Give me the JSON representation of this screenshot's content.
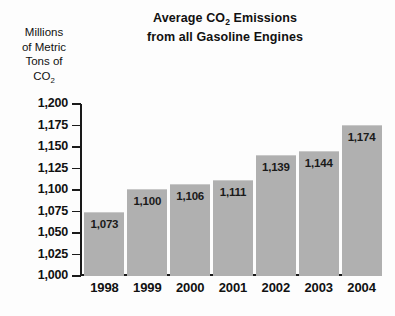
{
  "chart_data": {
    "type": "bar",
    "title": "Average CO2 Emissions from all Gasoline Engines",
    "title_lines": [
      "Average CO",
      "Emissions",
      "from all Gasoline Engines"
    ],
    "title_line1_prefix": "Average CO",
    "title_line1_sub": "2",
    "title_line1_suffix": " Emissions",
    "title_line2": "from all Gasoline Engines",
    "ylabel": "Millions of Metric Tons of CO2",
    "ylabel_lines": [
      "Millions",
      "of Metric",
      "Tons of"
    ],
    "ylabel_last_prefix": "CO",
    "ylabel_last_sub": "2",
    "xlabel": "",
    "categories": [
      "1998",
      "1999",
      "2000",
      "2001",
      "2002",
      "2003",
      "2004"
    ],
    "values": [
      1073,
      1100,
      1106,
      1111,
      1139,
      1144,
      1174
    ],
    "value_labels": [
      "1,073",
      "1,100",
      "1,106",
      "1,111",
      "1,139",
      "1,144",
      "1,174"
    ],
    "ylim": [
      1000,
      1200
    ],
    "ytick_values": [
      1200,
      1175,
      1150,
      1125,
      1100,
      1075,
      1050,
      1025,
      1000
    ],
    "ytick_labels": [
      "1,200",
      "1,175",
      "1,150",
      "1,125",
      "1,100",
      "1,075",
      "1,050",
      "1,025",
      "1,000"
    ],
    "grid": false,
    "legend": "none",
    "bar_color": "#b0b0b0",
    "axis_color": "#1a1a1a",
    "text_color": "#111111",
    "background_color": "#fdfdfd"
  }
}
